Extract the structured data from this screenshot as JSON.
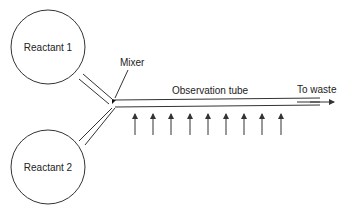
{
  "diagram": {
    "reservoirs": [
      {
        "label": "Reactant 1"
      },
      {
        "label": "Reactant 2"
      }
    ],
    "mixer_label": "Mixer",
    "tube_label": "Observation tube",
    "outlet_label": "To waste",
    "observation_arrows_count": 9,
    "stroke_color": "#333333",
    "text_color": "#222222",
    "background": "#ffffff"
  }
}
